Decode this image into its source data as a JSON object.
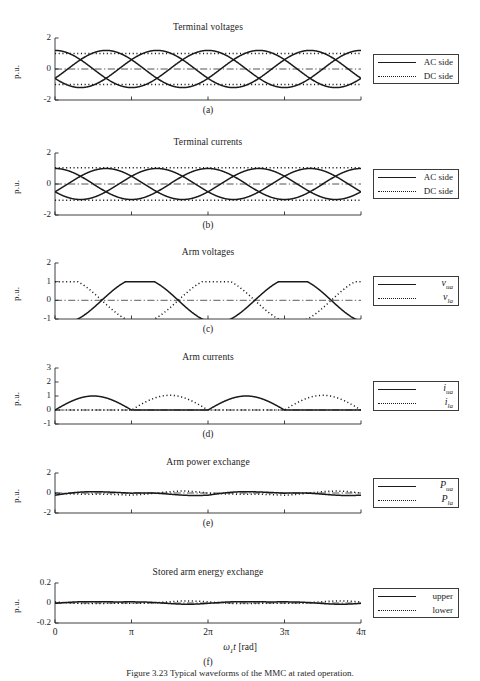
{
  "figure": {
    "caption": "Figure 3.23   Typical waveforms of the MMC at rated operation.",
    "xaxis_label_main": "ω",
    "xaxis_label_sub": "1",
    "xaxis_label_var": "t",
    "xaxis_label_unit": "[rad]",
    "ylabel": "p.u."
  },
  "chart_data": [
    {
      "type": "line",
      "panel": "a",
      "title": "Terminal voltages",
      "letter": "(a)",
      "xlabel": "ω1t [rad]",
      "ylabel": "p.u.",
      "xlim": [
        0,
        12.566370614
      ],
      "ylim": [
        -2,
        2
      ],
      "xticks": [
        0,
        3.14159,
        6.28319,
        9.42478,
        12.56637
      ],
      "xticklabels": [
        "0",
        "π",
        "2π",
        "3π",
        "4π"
      ],
      "yticks": [
        -2,
        0,
        2
      ],
      "yticklabels": [
        "-2",
        "0",
        "2"
      ],
      "legend": [
        {
          "label": "AC side",
          "style": "solid"
        },
        {
          "label": "DC side",
          "style": "dotted"
        }
      ],
      "series": [
        {
          "name": "v_a (AC side)",
          "style": "solid",
          "form": "sine",
          "amplitude": 1.2,
          "phase_deg": -30,
          "offset": 0
        },
        {
          "name": "v_b (AC side)",
          "style": "solid",
          "form": "sine",
          "amplitude": 1.2,
          "phase_deg": -150,
          "offset": 0
        },
        {
          "name": "v_c (AC side)",
          "style": "solid",
          "form": "sine",
          "amplitude": 1.2,
          "phase_deg": 90,
          "offset": 0
        },
        {
          "name": "v_dc+ (DC side)",
          "style": "dotted",
          "form": "constant",
          "value": 1.0
        },
        {
          "name": "v_dc- (DC side)",
          "style": "dotted",
          "form": "constant",
          "value": -1.0
        },
        {
          "name": "v_0 (DC side)",
          "style": "dashdot",
          "form": "constant",
          "value": 0.0
        }
      ]
    },
    {
      "type": "line",
      "panel": "b",
      "title": "Terminal currents",
      "letter": "(b)",
      "xlabel": "ω1t [rad]",
      "ylabel": "p.u.",
      "xlim": [
        0,
        12.566370614
      ],
      "ylim": [
        -2,
        2
      ],
      "xticks": [
        0,
        3.14159,
        6.28319,
        9.42478,
        12.56637
      ],
      "xticklabels": [
        "0",
        "π",
        "2π",
        "3π",
        "4π"
      ],
      "yticks": [
        -2,
        0,
        2
      ],
      "yticklabels": [
        "-2",
        "0",
        "2"
      ],
      "legend": [
        {
          "label": "AC side",
          "style": "solid"
        },
        {
          "label": "DC side",
          "style": "dotted"
        }
      ],
      "series": [
        {
          "name": "i_a (AC side)",
          "style": "solid",
          "form": "sine",
          "amplitude": 1.0,
          "phase_deg": -30,
          "offset": 0
        },
        {
          "name": "i_b (AC side)",
          "style": "solid",
          "form": "sine",
          "amplitude": 1.0,
          "phase_deg": -150,
          "offset": 0
        },
        {
          "name": "i_c (AC side)",
          "style": "solid",
          "form": "sine",
          "amplitude": 1.0,
          "phase_deg": 90,
          "offset": 0
        },
        {
          "name": "i_dc+ (DC side)",
          "style": "dotted",
          "form": "constant",
          "value": 1.05
        },
        {
          "name": "i_dc- (DC side)",
          "style": "dotted",
          "form": "constant",
          "value": -1.05
        },
        {
          "name": "i_0 (DC side)",
          "style": "dashdot",
          "form": "constant",
          "value": 0.0
        }
      ]
    },
    {
      "type": "line",
      "panel": "c",
      "title": "Arm voltages",
      "letter": "(c)",
      "xlabel": "ω1t [rad]",
      "ylabel": "p.u.",
      "xlim": [
        0,
        12.566370614
      ],
      "ylim": [
        -1,
        2
      ],
      "xticks": [
        0,
        3.14159,
        6.28319,
        9.42478,
        12.56637
      ],
      "xticklabels": [
        "0",
        "π",
        "2π",
        "3π",
        "4π"
      ],
      "yticks": [
        -1,
        0,
        1,
        2
      ],
      "yticklabels": [
        "-1",
        "0",
        "1",
        "2"
      ],
      "legend": [
        {
          "label": "v_ua",
          "style": "solid",
          "italic": true,
          "base": "v",
          "sub": "ua"
        },
        {
          "label": "v_la",
          "style": "dotted",
          "italic": true,
          "base": "v",
          "sub": "la"
        }
      ],
      "series": [
        {
          "name": "v_ua (upper arm)",
          "style": "solid",
          "form": "clamped-sine",
          "amplitude": 1.2,
          "phase_deg": -110,
          "clip_max": 1.0,
          "offset": 0
        },
        {
          "name": "v_la (lower arm)",
          "style": "dotted",
          "form": "clamped-sine",
          "amplitude": 1.2,
          "phase_deg": 70,
          "clip_max": 1.0,
          "offset": 0
        },
        {
          "name": "zero reference",
          "style": "dashdot",
          "form": "constant",
          "value": 0.0
        }
      ]
    },
    {
      "type": "line",
      "panel": "d",
      "title": "Arm currents",
      "letter": "(d)",
      "xlabel": "ω1t [rad]",
      "ylabel": "p.u.",
      "xlim": [
        0,
        12.566370614
      ],
      "ylim": [
        -1,
        3
      ],
      "xticks": [
        0,
        3.14159,
        6.28319,
        9.42478,
        12.56637
      ],
      "xticklabels": [
        "0",
        "π",
        "2π",
        "3π",
        "4π"
      ],
      "yticks": [
        -1,
        0,
        1,
        2,
        3
      ],
      "yticklabels": [
        "-1",
        "0",
        "1",
        "2",
        "3"
      ],
      "legend": [
        {
          "label": "i_ua",
          "style": "solid",
          "italic": true,
          "base": "i",
          "sub": "ua"
        },
        {
          "label": "i_la",
          "style": "dotted",
          "italic": true,
          "base": "i",
          "sub": "la"
        }
      ],
      "series": [
        {
          "name": "i_ua (upper arm)",
          "style": "solid",
          "form": "half-sine-pulse",
          "amplitude": 1.0,
          "phase_deg": 0,
          "floor": 0
        },
        {
          "name": "i_la (lower arm)",
          "style": "dotted",
          "form": "half-sine-pulse",
          "amplitude": 1.05,
          "phase_deg": 180,
          "floor": 0
        },
        {
          "name": "zero reference",
          "style": "dashdot",
          "form": "constant",
          "value": 0.0
        }
      ]
    },
    {
      "type": "line",
      "panel": "e",
      "title": "Arm power exchange",
      "letter": "(e)",
      "xlabel": "ω1t [rad]",
      "ylabel": "p.u.",
      "xlim": [
        0,
        12.566370614
      ],
      "ylim": [
        -2,
        2
      ],
      "xticks": [
        0,
        3.14159,
        6.28319,
        9.42478,
        12.56637
      ],
      "xticklabels": [
        "0",
        "π",
        "2π",
        "3π",
        "4π"
      ],
      "yticks": [
        -2,
        0,
        2
      ],
      "yticklabels": [
        "-2",
        "0",
        "2"
      ],
      "legend": [
        {
          "label": "P_ua",
          "style": "solid",
          "italic": true,
          "base": "P",
          "sub": "ua"
        },
        {
          "label": "P_la",
          "style": "dotted",
          "italic": true,
          "base": "P",
          "sub": "la"
        }
      ],
      "series": [
        {
          "name": "P_ua (upper arm)",
          "style": "solid",
          "form": "ripple",
          "amplitude": 0.25,
          "mean": -0.12
        },
        {
          "name": "P_la (lower arm)",
          "style": "dotted",
          "form": "ripple",
          "amplitude": 0.25,
          "mean": -0.12,
          "phase_deg": 180
        },
        {
          "name": "zero reference",
          "style": "dashdot",
          "form": "constant",
          "value": 0.0
        }
      ]
    },
    {
      "type": "line",
      "panel": "f",
      "title": "Stored arm energy exchange",
      "letter": "(f)",
      "xlabel": "ω1t [rad]",
      "ylabel": "p.u.",
      "xlim": [
        0,
        12.566370614
      ],
      "ylim": [
        -0.2,
        0.2
      ],
      "xticks": [
        0,
        3.14159,
        6.28319,
        9.42478,
        12.56637
      ],
      "xticklabels": [
        "0",
        "π",
        "2π",
        "3π",
        "4π"
      ],
      "yticks": [
        -0.2,
        0,
        0.2
      ],
      "yticklabels": [
        "-0.2",
        "0",
        "0.2"
      ],
      "legend": [
        {
          "label": "upper",
          "style": "solid"
        },
        {
          "label": "lower",
          "style": "dotted"
        }
      ],
      "series": [
        {
          "name": "upper arm stored energy",
          "style": "solid",
          "form": "energy-ripple",
          "amplitude": 0.025,
          "mean": 0.004
        },
        {
          "name": "lower arm stored energy",
          "style": "dotted",
          "form": "energy-ripple",
          "amplitude": 0.025,
          "mean": 0.004,
          "phase_deg": 180
        },
        {
          "name": "zero reference",
          "style": "dashdot",
          "form": "constant",
          "value": 0.0
        }
      ]
    }
  ]
}
